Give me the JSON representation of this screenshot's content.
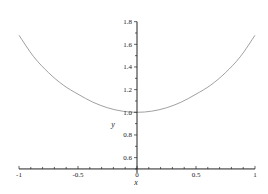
{
  "chart_data": {
    "type": "line",
    "title": "",
    "xlabel": "x",
    "ylabel": "y",
    "xlim": [
      -1,
      1
    ],
    "ylim": [
      0.5,
      1.8
    ],
    "x_ticks": [
      -1,
      -0.5,
      0,
      0.5,
      1
    ],
    "x_tick_labels": [
      "-1",
      "-0.5",
      "0",
      "0.5",
      "1"
    ],
    "y_ticks": [
      0.6,
      0.8,
      1.0,
      1.2,
      1.4,
      1.6,
      1.8
    ],
    "y_tick_labels": [
      "0.6",
      "0.8",
      "1.0",
      "1.2",
      "1.4",
      "1.6",
      "1.8"
    ],
    "minor_tick_step": 0.1,
    "grid": false,
    "legend": null,
    "series": [
      {
        "name": "y(x)",
        "color": "#888888",
        "x": [
          -1,
          -0.875,
          -0.75,
          -0.625,
          -0.5,
          -0.375,
          -0.25,
          -0.125,
          0,
          0.125,
          0.25,
          0.375,
          0.5,
          0.625,
          0.75,
          0.875,
          1
        ],
        "y": [
          1.68,
          1.49,
          1.35,
          1.24,
          1.16,
          1.09,
          1.04,
          1.01,
          1.0,
          1.01,
          1.04,
          1.09,
          1.16,
          1.24,
          1.35,
          1.49,
          1.68
        ]
      }
    ]
  }
}
